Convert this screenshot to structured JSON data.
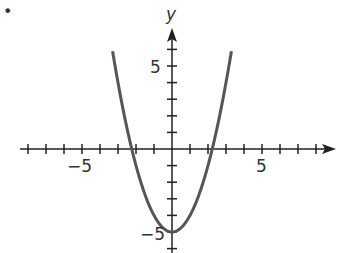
{
  "bullet": "•",
  "chart_data": {
    "type": "line",
    "title": "",
    "xlabel": "",
    "ylabel": "y",
    "function": "y = x^2 - 5",
    "xlim": [
      -8.5,
      8.5
    ],
    "ylim": [
      -6,
      7
    ],
    "x_tick_labels": [
      "-5",
      "5"
    ],
    "y_tick_labels": [
      "5",
      "-5"
    ],
    "x_ticks": [
      -8,
      -7,
      -6,
      -5,
      -4,
      -3,
      -2,
      -1,
      1,
      2,
      3,
      4,
      5,
      6,
      7,
      8
    ],
    "y_ticks": [
      -6,
      -5,
      -4,
      -3,
      -2,
      -1,
      1,
      2,
      3,
      4,
      5,
      6
    ],
    "grid": false,
    "series": [
      {
        "name": "parabola",
        "x": [
          -3.3,
          -3,
          -2.5,
          -2,
          -1.5,
          -1,
          -0.5,
          0,
          0.5,
          1,
          1.5,
          2,
          2.5,
          3,
          3.3
        ],
        "y": [
          5.89,
          4,
          1.25,
          -1,
          -2.75,
          -4,
          -4.75,
          -5,
          -4.75,
          -4,
          -2.75,
          -1,
          1.25,
          4,
          5.89
        ]
      }
    ],
    "vertex": [
      0,
      -5
    ],
    "roots": [
      -2.24,
      2.24
    ],
    "colors": {
      "curve": "#555555",
      "axes": "#222222"
    }
  },
  "labels": {
    "x_neg5": "−5",
    "x_pos5": "5",
    "y_pos5": "5",
    "y_neg5": "−5",
    "y_axis": "y"
  }
}
